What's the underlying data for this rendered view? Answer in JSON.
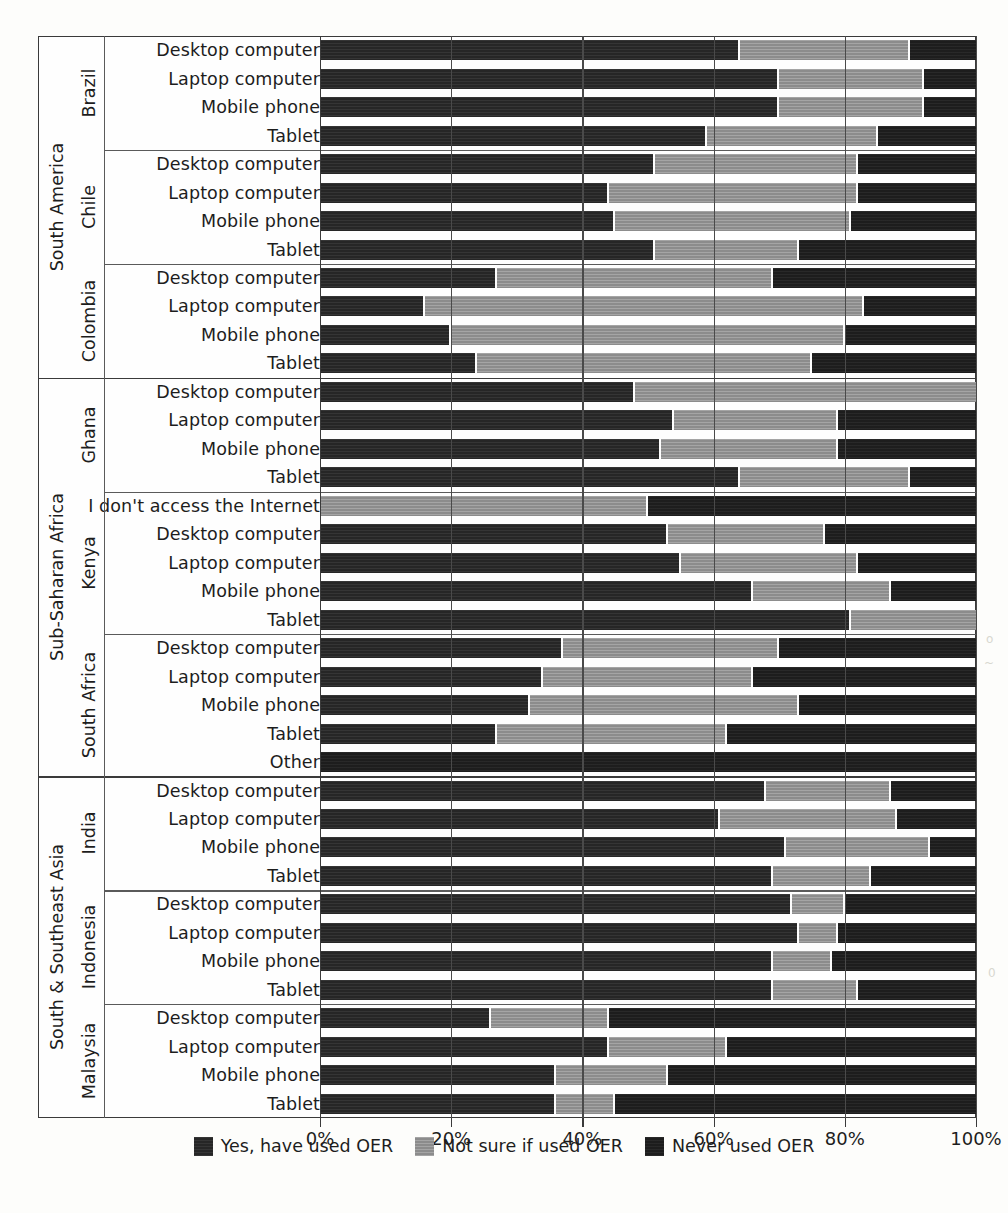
{
  "chart_data": {
    "type": "bar",
    "subtype": "stacked-horizontal-100pct",
    "title": "",
    "xlabel": "",
    "ylabel": "",
    "xlim": [
      0,
      100
    ],
    "xticks": [
      "0%",
      "20%",
      "40%",
      "60%",
      "80%",
      "100%"
    ],
    "xtick_values": [
      0,
      20,
      40,
      60,
      80,
      100
    ],
    "grid": true,
    "legend_position": "bottom",
    "series": [
      {
        "name": "Yes, have used OER",
        "key": "yes",
        "color": "#262626"
      },
      {
        "name": "Not sure if used OER",
        "key": "notsure",
        "color": "#8c8c8c"
      },
      {
        "name": "Never used OER",
        "key": "never",
        "color": "#1d1d1d"
      }
    ],
    "regions": [
      {
        "name": "South America",
        "countries": [
          {
            "name": "Brazil",
            "rows": [
              {
                "label": "Desktop computer",
                "values": [
                  64,
                  26,
                  10
                ]
              },
              {
                "label": "Laptop computer",
                "values": [
                  70,
                  22,
                  8
                ]
              },
              {
                "label": "Mobile phone",
                "values": [
                  70,
                  22,
                  8
                ]
              },
              {
                "label": "Tablet",
                "values": [
                  59,
                  26,
                  15
                ]
              }
            ]
          },
          {
            "name": "Chile",
            "rows": [
              {
                "label": "Desktop computer",
                "values": [
                  51,
                  31,
                  18
                ]
              },
              {
                "label": "Laptop computer",
                "values": [
                  44,
                  38,
                  18
                ]
              },
              {
                "label": "Mobile phone",
                "values": [
                  45,
                  36,
                  19
                ]
              },
              {
                "label": "Tablet",
                "values": [
                  51,
                  22,
                  27
                ]
              }
            ]
          },
          {
            "name": "Colombia",
            "rows": [
              {
                "label": "Desktop computer",
                "values": [
                  27,
                  42,
                  31
                ]
              },
              {
                "label": "Laptop computer",
                "values": [
                  16,
                  67,
                  17
                ]
              },
              {
                "label": "Mobile phone",
                "values": [
                  20,
                  60,
                  20
                ]
              },
              {
                "label": "Tablet",
                "values": [
                  24,
                  51,
                  25
                ]
              }
            ]
          }
        ]
      },
      {
        "name": "Sub-Saharan Africa",
        "countries": [
          {
            "name": "Ghana",
            "rows": [
              {
                "label": "Desktop computer",
                "values": [
                  48,
                  52,
                  0
                ]
              },
              {
                "label": "Laptop computer",
                "values": [
                  54,
                  25,
                  21
                ]
              },
              {
                "label": "Mobile phone",
                "values": [
                  52,
                  27,
                  21
                ]
              },
              {
                "label": "Tablet",
                "values": [
                  64,
                  26,
                  10
                ]
              }
            ]
          },
          {
            "name": "Kenya",
            "rows": [
              {
                "label": "I don't access the Internet",
                "values": [
                  0,
                  50,
                  50
                ]
              },
              {
                "label": "Desktop computer",
                "values": [
                  53,
                  24,
                  23
                ]
              },
              {
                "label": "Laptop computer",
                "values": [
                  55,
                  27,
                  18
                ]
              },
              {
                "label": "Mobile phone",
                "values": [
                  66,
                  21,
                  13
                ]
              },
              {
                "label": "Tablet",
                "values": [
                  81,
                  19,
                  0
                ]
              }
            ]
          },
          {
            "name": "South Africa",
            "rows": [
              {
                "label": "Desktop computer",
                "values": [
                  37,
                  33,
                  30
                ]
              },
              {
                "label": "Laptop computer",
                "values": [
                  34,
                  32,
                  34
                ]
              },
              {
                "label": "Mobile phone",
                "values": [
                  32,
                  41,
                  27
                ]
              },
              {
                "label": "Tablet",
                "values": [
                  27,
                  35,
                  38
                ]
              },
              {
                "label": "Other",
                "values": [
                  0,
                  0,
                  100
                ]
              }
            ]
          }
        ]
      },
      {
        "name": "South & Southeast Asia",
        "countries": [
          {
            "name": "India",
            "rows": [
              {
                "label": "Desktop computer",
                "values": [
                  68,
                  19,
                  13
                ]
              },
              {
                "label": "Laptop computer",
                "values": [
                  61,
                  27,
                  12
                ]
              },
              {
                "label": "Mobile phone",
                "values": [
                  71,
                  22,
                  7
                ]
              },
              {
                "label": "Tablet",
                "values": [
                  69,
                  15,
                  16
                ]
              }
            ]
          },
          {
            "name": "Indonesia",
            "rows": [
              {
                "label": "Desktop computer",
                "values": [
                  72,
                  8,
                  20
                ]
              },
              {
                "label": "Laptop computer",
                "values": [
                  73,
                  6,
                  21
                ]
              },
              {
                "label": "Mobile phone",
                "values": [
                  69,
                  9,
                  22
                ]
              },
              {
                "label": "Tablet",
                "values": [
                  69,
                  13,
                  18
                ]
              }
            ]
          },
          {
            "name": "Malaysia",
            "rows": [
              {
                "label": "Desktop computer",
                "values": [
                  26,
                  18,
                  56
                ]
              },
              {
                "label": "Laptop computer",
                "values": [
                  44,
                  18,
                  38
                ]
              },
              {
                "label": "Mobile phone",
                "values": [
                  36,
                  17,
                  47
                ]
              },
              {
                "label": "Tablet",
                "values": [
                  36,
                  9,
                  55
                ]
              }
            ]
          }
        ]
      }
    ]
  }
}
